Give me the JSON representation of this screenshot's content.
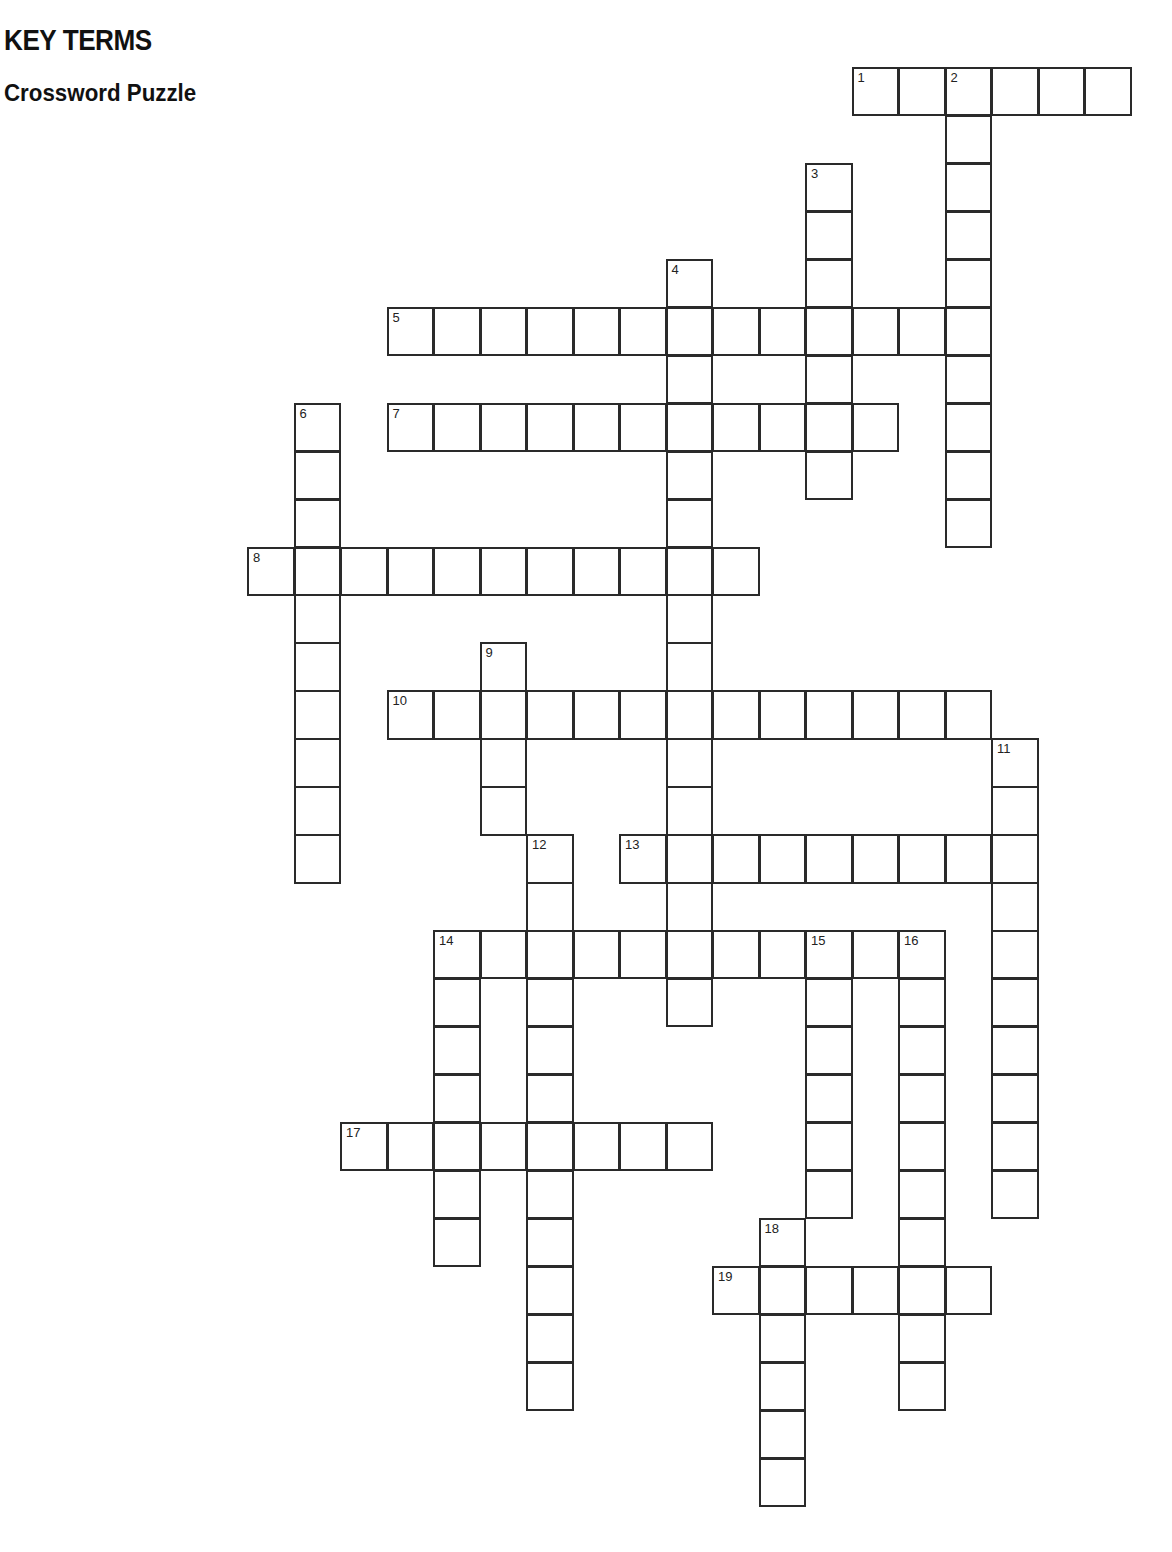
{
  "header": {
    "title": "KEY TERMS",
    "subtitle": "Crossword Puzzle"
  },
  "grid": {
    "origin_x": 247,
    "origin_y": 67,
    "cell_w": 46.5,
    "cell_h": 47.95,
    "line_color": "#2a2a2a"
  },
  "words": [
    {
      "number": 1,
      "direction": "across",
      "row": 0,
      "col": 13,
      "length": 6
    },
    {
      "number": 2,
      "direction": "down",
      "row": 0,
      "col": 15,
      "length": 10
    },
    {
      "number": 3,
      "direction": "down",
      "row": 2,
      "col": 12,
      "length": 7
    },
    {
      "number": 4,
      "direction": "down",
      "row": 4,
      "col": 9,
      "length": 16
    },
    {
      "number": 5,
      "direction": "across",
      "row": 5,
      "col": 3,
      "length": 13
    },
    {
      "number": 6,
      "direction": "down",
      "row": 7,
      "col": 1,
      "length": 10
    },
    {
      "number": 7,
      "direction": "across",
      "row": 7,
      "col": 3,
      "length": 11
    },
    {
      "number": 8,
      "direction": "across",
      "row": 10,
      "col": 0,
      "length": 11
    },
    {
      "number": 9,
      "direction": "down",
      "row": 12,
      "col": 5,
      "length": 4
    },
    {
      "number": 10,
      "direction": "across",
      "row": 13,
      "col": 3,
      "length": 13
    },
    {
      "number": 11,
      "direction": "down",
      "row": 14,
      "col": 16,
      "length": 10
    },
    {
      "number": 12,
      "direction": "down",
      "row": 16,
      "col": 6,
      "length": 12
    },
    {
      "number": 13,
      "direction": "across",
      "row": 16,
      "col": 8,
      "length": 9
    },
    {
      "number": 14,
      "direction": "across",
      "row": 18,
      "col": 4,
      "length": 11
    },
    {
      "number": 14,
      "direction": "down",
      "row": 18,
      "col": 4,
      "length": 7
    },
    {
      "number": 15,
      "direction": "down",
      "row": 18,
      "col": 12,
      "length": 6
    },
    {
      "number": 16,
      "direction": "down",
      "row": 18,
      "col": 14,
      "length": 10
    },
    {
      "number": 17,
      "direction": "across",
      "row": 22,
      "col": 2,
      "length": 8
    },
    {
      "number": 18,
      "direction": "down",
      "row": 24,
      "col": 11,
      "length": 6
    },
    {
      "number": 19,
      "direction": "across",
      "row": 25,
      "col": 10,
      "length": 6
    }
  ]
}
